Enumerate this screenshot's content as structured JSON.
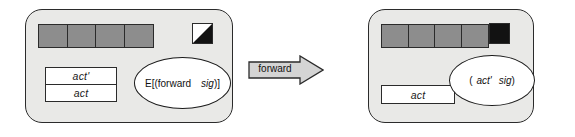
{
  "diagram": {
    "type": "state-transition",
    "panels": [
      {
        "id": "before",
        "name": "state-before",
        "cells": [
          "",
          "",
          "",
          ""
        ],
        "cell_color": "#8d8d8d",
        "icon": "half-filled-square-icon",
        "boxes": [
          {
            "label": "act'"
          },
          {
            "label": "act"
          }
        ],
        "ellipse": {
          "prefix": "E[(",
          "word": "forward",
          "italic_word": "sig",
          "suffix": ")]"
        }
      },
      {
        "id": "after",
        "name": "state-after",
        "cells": [
          "",
          "",
          "",
          ""
        ],
        "cell_color": "#8d8d8d",
        "icon": "solid-black-square-icon",
        "boxes": [
          {
            "label": "act"
          }
        ],
        "ellipse": {
          "prefix": "(",
          "word": "act'",
          "italic_word": "sig",
          "suffix": ")"
        }
      }
    ],
    "arrow": {
      "label": "forward",
      "direction": "right",
      "fill": "#d4d4d4"
    },
    "colors": {
      "panel_fill": "#e9e9e7",
      "cell_fill": "#8d8d8d",
      "stroke": "#2b2b2b",
      "box_fill": "#ffffff",
      "icon_fill": "#121212"
    }
  }
}
